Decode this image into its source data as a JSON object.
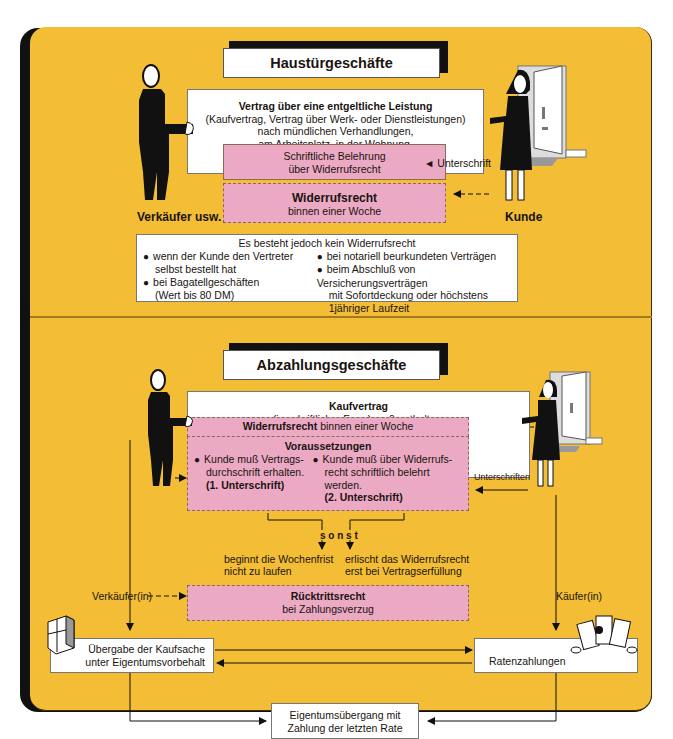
{
  "colors": {
    "background": "#F3BD36",
    "pink": "#EBA9C3",
    "frame": "#111111",
    "box": "#ffffff"
  },
  "haustuer": {
    "title": "Haustürgeschäfte",
    "contract": {
      "heading": "Vertrag über eine entgeltliche Leistung",
      "lines": [
        "(Kaufvertrag, Vertrag über Werk- oder Dienstleistungen)",
        "nach mündlichen Verhandlungen,",
        "am Arbeitsplatz, in der Wohnung,",
        "auf Kaffeefahrten oder auf der Straße."
      ]
    },
    "belehrung": {
      "line1": "Schriftliche Belehrung",
      "line2": "über Widerrufsrecht"
    },
    "signature_label": "◄ Unterschrift",
    "widerruf": {
      "heading": "Widerrufsrecht",
      "sub": "binnen einer Woche"
    },
    "seller_label": "Verkäufer usw.",
    "customer_label": "Kunde",
    "exceptions": {
      "heading": "Es besteht jedoch kein Widerrufsrecht",
      "left": [
        {
          "line1": "wenn der Kunde den Vertreter",
          "line2": "selbst bestellt hat"
        },
        {
          "line1": "bei Bagatellgeschäften",
          "line2": "(Wert bis 80 DM)"
        }
      ],
      "right": [
        {
          "line1": "bei notariell beurkundeten Verträgen"
        },
        {
          "line1": "beim Abschluß von Versicherungsverträgen",
          "line2": "mit Sofortdeckung oder höchstens",
          "line3": "1jähriger Laufzeit"
        }
      ]
    }
  },
  "abzahlung": {
    "title": "Abzahlungsgeschäfte",
    "contract": {
      "heading": "Kaufvertrag",
      "sub": "(in schriftlicher Form) muß enthalten:",
      "items": [
        "Barzahlungspreis",
        "Teilzahlungspreis",
        "Zahl. Betrag und Fälligkeit der Raten",
        "Effektiver Jahreszins"
      ]
    },
    "widerruf": {
      "heading": "Widerrufsrecht",
      "rest": " binnen einer Woche"
    },
    "voraussetzungen": {
      "heading": "Voraussetzungen",
      "left": {
        "line1": "Kunde muß Vertrags-",
        "line2": "durchschrift erhalten.",
        "line3": "(1. Unterschrift)"
      },
      "right": {
        "line1": "Kunde muß über Widerrufs-",
        "line2": "recht schriftlich belehrt werden.",
        "line3": "(2. Unterschrift)"
      }
    },
    "signatures_label": "Unterschriften",
    "sonst": "s o n s t",
    "outcome_left": {
      "line1": "beginnt die Wochenfrist",
      "line2": "nicht zu laufen"
    },
    "outcome_right": {
      "line1": "erlischt das Widerrufsrecht",
      "line2": "erst bei Vertragserfüllung"
    },
    "seller_label": "Verkäufer(in)",
    "buyer_label": "Käufer(in)",
    "ruecktritt": {
      "heading": "Rücktrittsrecht",
      "sub": "bei Zahlungsverzug"
    },
    "uebergabe": {
      "line1": "Übergabe der Kaufsache",
      "line2": "unter Eigentumsvorbehalt"
    },
    "raten": "Ratenzahlungen",
    "eigentum": {
      "line1": "Eigentumsübergang mit",
      "line2": "Zahlung der letzten Rate"
    }
  }
}
